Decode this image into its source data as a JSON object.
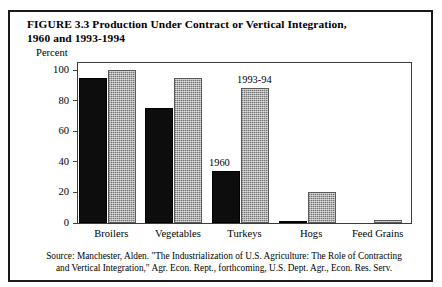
{
  "figure": {
    "title_line1": "FIGURE 3.3  Production Under Contract or Vertical Integration,",
    "title_line2": "1960 and 1993-1994",
    "source_line1": "Source: Manchester, Alden. \"The Industrialization of U.S. Agriculture: The Role of Contracting",
    "source_line2": "and Vertical Integration,\" Agr. Econ. Rept., forthcoming, U.S. Dept. Agr., Econ. Res. Serv."
  },
  "chart_data": {
    "type": "bar",
    "title": "FIGURE 3.3  Production Under Contract or Vertical Integration, 1960 and 1993-1994",
    "xlabel": "",
    "ylabel": "Percent",
    "ylim": [
      0,
      100
    ],
    "yticks": [
      0,
      20,
      40,
      60,
      80,
      100
    ],
    "ytick_labels": [
      "0",
      "20",
      "40",
      "60",
      "80",
      "100"
    ],
    "grid": false,
    "legend_position": "inline-annotation",
    "categories": [
      "Broilers",
      "Vegetables",
      "Turkeys",
      "Hogs",
      "Feed Grains"
    ],
    "series": [
      {
        "name": "1960",
        "color": "#0d0d0d",
        "values": [
          95,
          75,
          34,
          1.5,
          0
        ]
      },
      {
        "name": "1993-94",
        "color": "#adadad",
        "values": [
          100,
          95,
          88,
          20,
          2
        ]
      }
    ],
    "annotations": [
      {
        "text": "1960",
        "series": "1960",
        "category": "Turkeys"
      },
      {
        "text": "1993-94",
        "series": "1993-94",
        "category": "Turkeys"
      }
    ]
  }
}
